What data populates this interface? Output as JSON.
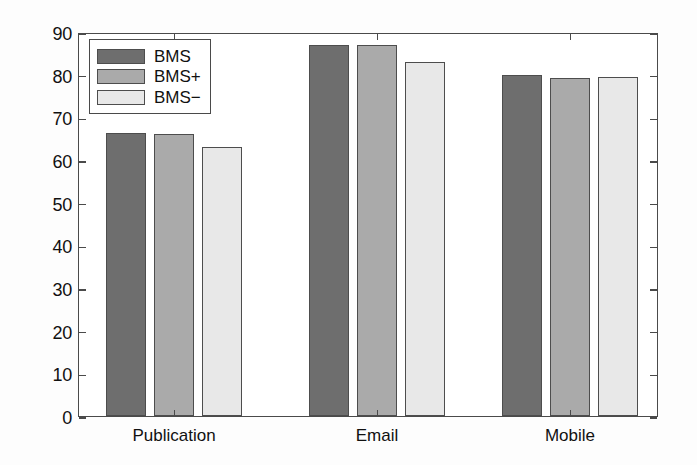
{
  "chart_data": {
    "type": "bar",
    "title": "",
    "xlabel": "",
    "ylabel": "Average F1−score of learning curves",
    "categories": [
      "Publication",
      "Email",
      "Mobile"
    ],
    "series": [
      {
        "name": "BMS",
        "color": "#6e6e6e",
        "values": [
          66.3,
          87.0,
          80.0
        ]
      },
      {
        "name": "BMS+",
        "color": "#aaaaaa",
        "values": [
          66.0,
          87.0,
          79.3
        ]
      },
      {
        "name": "BMS−",
        "color": "#e8e8e8",
        "values": [
          63.0,
          83.0,
          79.5
        ]
      }
    ],
    "ylim": [
      0,
      90
    ],
    "yticks": [
      0,
      10,
      20,
      30,
      40,
      50,
      60,
      70,
      80,
      90
    ],
    "ytick_labels": [
      "0",
      "10",
      "20",
      "30",
      "40",
      "50",
      "60",
      "70",
      "80",
      "90"
    ],
    "grid": false,
    "legend_position": "upper left",
    "axis_color": "#4a4a4a",
    "bar_edge_color": "#4d4d4d",
    "background": "#ffffff"
  },
  "legend": {
    "entries": [
      {
        "label": "BMS",
        "color": "#6e6e6e"
      },
      {
        "label": "BMS+",
        "color": "#aaaaaa"
      },
      {
        "label": "BMS−",
        "color": "#e8e8e8"
      }
    ]
  }
}
